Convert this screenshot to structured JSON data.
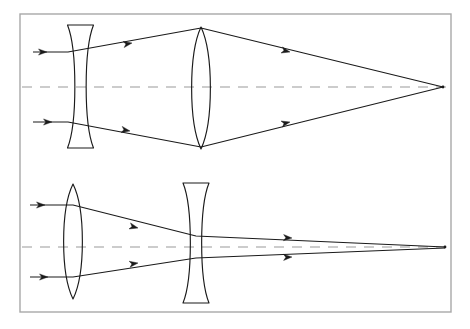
{
  "figure": {
    "background_color": "#ffffff",
    "ray_color": "#1a1a1a",
    "lens_color": "#1a1a1a",
    "axis_color": "#9a9a9a",
    "frame_color": "#a8a8a8"
  },
  "frame": {
    "name": "outer-border",
    "x": 20,
    "y": 14,
    "width": 431,
    "height": 298,
    "stroke_width": 1.4
  },
  "diagrams": [
    {
      "id": "top-diagram",
      "label": "Galilean-style: diverging lens then converging lens",
      "axis": {
        "label": "optical-axis",
        "y": 87,
        "x_start": 22,
        "x_end": 449,
        "dash": "10 8"
      },
      "lenses": [
        {
          "id": "top-concave-lens",
          "type": "biconcave",
          "role": "diverging",
          "center_x": 80.5,
          "top_y": 25,
          "bottom_y": 148,
          "edge_half_width": 13,
          "waist_half_width": 3.2
        },
        {
          "id": "top-convex-lens",
          "type": "biconvex",
          "role": "converging",
          "center_x": 201,
          "top_y": 27,
          "bottom_y": 149,
          "center_half_width": 12.5
        }
      ],
      "rays": [
        {
          "id": "top-upper-ray",
          "points": "33,52 68,52 201,28 443,87",
          "arrow_positions": [
            [
              47,
              52
            ],
            [
              132,
              43
            ],
            [
              290,
              52
            ]
          ]
        },
        {
          "id": "top-lower-ray",
          "points": "33,122 68,122 201,147 443,87",
          "arrow_positions": [
            [
              52,
              122
            ],
            [
              130,
              131
            ],
            [
              290,
              122
            ]
          ]
        }
      ],
      "focus_point": {
        "x": 443,
        "y": 87,
        "label": "focal-point"
      }
    },
    {
      "id": "bottom-diagram",
      "label": "Converging lens then diverging lens",
      "axis": {
        "label": "optical-axis",
        "y": 247,
        "x_start": 22,
        "x_end": 449,
        "dash": "10 8"
      },
      "lenses": [
        {
          "id": "bottom-convex-lens",
          "type": "biconvex",
          "role": "converging",
          "center_x": 73,
          "top_y": 184,
          "bottom_y": 299,
          "center_half_width": 12.5
        },
        {
          "id": "bottom-concave-lens",
          "type": "biconcave",
          "role": "diverging",
          "center_x": 196,
          "top_y": 183,
          "bottom_y": 303,
          "edge_half_width": 13,
          "waist_half_width": 3.2
        }
      ],
      "rays": [
        {
          "id": "bottom-upper-ray",
          "points": "30,205 73,205 196,236 445,247",
          "arrow_positions": [
            [
              45,
              205
            ],
            [
              138,
              228
            ],
            [
              292,
              238
            ]
          ]
        },
        {
          "id": "bottom-lower-ray",
          "points": "30,277 73,277 196,258 445,248",
          "arrow_positions": [
            [
              48,
              277
            ],
            [
              138,
              263
            ],
            [
              292,
              257
            ]
          ]
        }
      ],
      "focus_point": {
        "x": 445,
        "y": 247,
        "label": "focal-point"
      }
    }
  ]
}
